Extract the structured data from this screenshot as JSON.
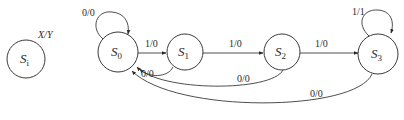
{
  "diagram": {
    "type": "state-machine",
    "legend": {
      "state": {
        "name": "S",
        "sub": "i"
      },
      "label": "X/Y"
    },
    "states": [
      {
        "id": "S0",
        "name": "S",
        "sub": "0"
      },
      {
        "id": "S1",
        "name": "S",
        "sub": "1"
      },
      {
        "id": "S2",
        "name": "S",
        "sub": "2"
      },
      {
        "id": "S3",
        "name": "S",
        "sub": "3"
      }
    ],
    "transitions": [
      {
        "from": "S0",
        "to": "S0",
        "label": "0/0"
      },
      {
        "from": "S0",
        "to": "S1",
        "label": "1/0"
      },
      {
        "from": "S1",
        "to": "S2",
        "label": "1/0"
      },
      {
        "from": "S2",
        "to": "S3",
        "label": "1/0"
      },
      {
        "from": "S3",
        "to": "S3",
        "label": "1/1"
      },
      {
        "from": "S1",
        "to": "S0",
        "label": "0/0"
      },
      {
        "from": "S2",
        "to": "S0",
        "label": "0/0"
      },
      {
        "from": "S3",
        "to": "S0",
        "label": "0/0"
      }
    ]
  }
}
